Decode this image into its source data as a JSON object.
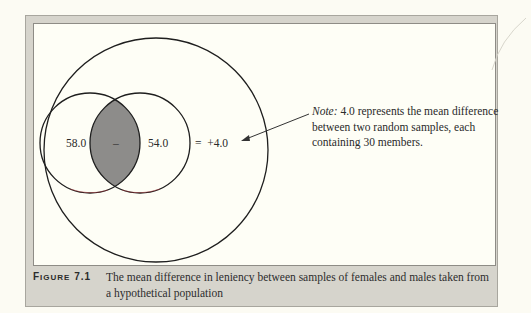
{
  "figure": {
    "label_prefix": "F",
    "label_rest": "IGURE",
    "number": "7.1",
    "caption": "The mean difference in leniency between samples of females and males taken from a hypothetical population"
  },
  "diagram": {
    "left_sample_value": "58.0",
    "operator_minus": "–",
    "right_sample_value": "54.0",
    "result": "=  +4.0",
    "note_label": "Note:",
    "note_text": " 4.0 represents the mean difference between two random samples, each containing 30 members.",
    "colors": {
      "overlap_fill": "#8d8c8a",
      "stroke": "#1e1e1e",
      "panel_bg": "#fefef6",
      "frame_bg": "#d6d4cc"
    }
  }
}
